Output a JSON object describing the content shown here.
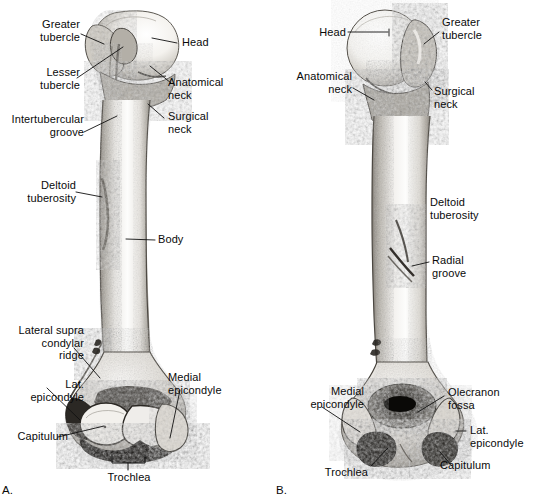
{
  "figure": {
    "panels": [
      {
        "id": "A",
        "id_label": "A.",
        "view": "anterior",
        "labels": [
          {
            "key": "greater_tubercle",
            "text": "Greater\ntubercle"
          },
          {
            "key": "lesser_tubercle",
            "text": "Lesser\ntubercle"
          },
          {
            "key": "intertubercular_groove",
            "text": "Intertubercular\ngroove"
          },
          {
            "key": "deltoid_tuberosity",
            "text": "Deltoid\ntuberosity"
          },
          {
            "key": "lateral_supracondylar_ridge",
            "text": "Lateral supra\ncondylar\nridge"
          },
          {
            "key": "lat_epicondyle",
            "text": "Lat.\nepicondyle"
          },
          {
            "key": "capitulum",
            "text": "Capitulum"
          },
          {
            "key": "head",
            "text": "Head"
          },
          {
            "key": "anatomical_neck",
            "text": "Anatomical\nneck"
          },
          {
            "key": "surgical_neck",
            "text": "Surgical\nneck"
          },
          {
            "key": "body",
            "text": "Body"
          },
          {
            "key": "medial_epicondyle",
            "text": "Medial\nepicondyle"
          },
          {
            "key": "trochlea",
            "text": "Trochlea"
          }
        ]
      },
      {
        "id": "B",
        "id_label": "B.",
        "view": "posterior",
        "labels": [
          {
            "key": "head",
            "text": "Head"
          },
          {
            "key": "anatomical_neck",
            "text": "Anatomical\nneck"
          },
          {
            "key": "medial_epicondyle",
            "text": "Medial\nepicondyle"
          },
          {
            "key": "trochlea",
            "text": "Trochlea"
          },
          {
            "key": "greater_tubercle",
            "text": "Greater\ntubercle"
          },
          {
            "key": "surgical_neck",
            "text": "Surgical\nneck"
          },
          {
            "key": "deltoid_tuberosity",
            "text": "Deltoid\ntuberosity"
          },
          {
            "key": "radial_groove",
            "text": "Radial\ngroove"
          },
          {
            "key": "olecranon_fossa",
            "text": "Olecranon\nfossa"
          },
          {
            "key": "lat_epicondyle",
            "text": "Lat.\nepicondyle"
          },
          {
            "key": "capitulum",
            "text": "Capitulum"
          }
        ]
      }
    ]
  },
  "colors": {
    "background": "#ffffff",
    "ink": "#0a0a0a",
    "bone_light": "#f7f6f3",
    "bone_mid": "#b9b5ae",
    "bone_dark": "#3a3733",
    "leader": "#111111"
  }
}
